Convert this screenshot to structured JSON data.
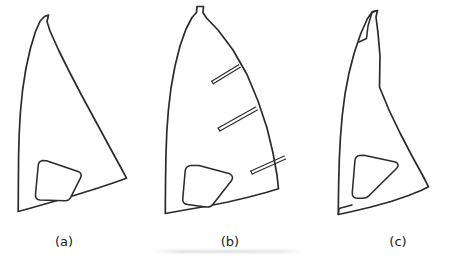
{
  "figure": {
    "background_color": "#ffffff",
    "line_color": "#2b2b2b",
    "panels": [
      {
        "id": "a",
        "caption": "(a)",
        "caption_x": 64,
        "description": "Soft sail outline with curved luff, straight leech, curved foot and a rounded trapezoidal window",
        "features": {
          "head_notch": true,
          "batten_count": 0,
          "luff_sleeve": false,
          "window_shape": "rounded-trapezoid"
        },
        "outline_path": "M 44.5 16.5 L 40.2 21.0 L 35.5 31.5 L 30.5 48.0 L 26.0 68.0 L 22.6 90.0 L 20.4 112.0 L 19.2 134.0 L 18.6 156.0 L 18.4 178.0 L 18.3 196.0 L 18.2 211.5 L 31.0 208.0 L 52.0 202.0 L 74.0 195.5 L 95.0 189.0 L 113.0 183.0 L 126.5 178.2 L 120.0 166.0 L 108.0 144.0 L 95.0 120.0 L 82.0 96.0 L 70.0 73.0 L 59.0 51.0 L 50.0 31.0 L 47.0 21.5 L 48.5 15.0 Z",
        "window_path": "M 42.5 160.5 C 40.0 161.0 38.5 162.8 38.2 165.5 L 35.5 194.5 C 35.2 197.8 36.8 199.8 40.0 200.0 L 65.0 200.8 C 67.8 200.9 69.6 199.6 70.8 197.2 L 80.5 177.8 C 82.0 174.8 81.0 172.5 78.0 171.4 L 46.5 160.8 Z"
      },
      {
        "id": "b",
        "caption": "(b)",
        "caption_x": 230,
        "description": "Fuller roached sail outline with three batten pockets along the leech and a rounded pentagonal window",
        "features": {
          "head_notch": true,
          "batten_count": 3,
          "luff_sleeve": false,
          "window_shape": "rounded-pentagon"
        },
        "outline_path": "M 196.5 12.5 L 192.0 17.5 L 186.0 29.0 L 180.0 46.0 L 175.0 66.0 L 171.0 88.0 L 168.4 110.0 L 166.8 132.0 L 166.0 154.0 L 165.6 176.0 L 165.4 196.0 L 165.3 213.5 L 182.0 210.5 L 205.0 206.5 L 228.0 202.0 L 249.0 197.0 L 266.0 192.5 L 278.5 188.8 L 277.0 175.0 L 273.0 153.0 L 267.0 128.0 L 258.0 101.0 L 247.0 74.5 L 233.0 50.0 L 218.0 30.0 L 206.5 18.0 L 203.0 12.5 L 203.5 6.5 L 197.0 6.5 Z",
        "window_path": "M 190.5 165.5 C 187.5 166.0 185.6 167.8 185.2 170.8 L 182.8 198.5 C 182.5 202.0 184.2 204.2 187.6 204.6 L 206.0 207.0 C 209.0 207.4 211.2 206.5 213.0 204.2 L 231.2 181.0 C 233.4 178.2 232.9 175.6 229.8 173.8 L 199.0 165.5 Z",
        "battens": [
          {
            "index": 1,
            "inner": [
              212.5,
              82.5
            ],
            "outer": [
              239.5,
              66.0
            ],
            "thickness": 3.0
          },
          {
            "index": 2,
            "inner": [
              219.0,
              129.5
            ],
            "outer": [
              256.5,
              108.5
            ],
            "thickness": 3.2
          },
          {
            "index": 3,
            "inner": [
              251.5,
              172.5
            ],
            "outer": [
              285.0,
              157.5
            ],
            "thickness": 3.2
          }
        ]
      },
      {
        "id": "c",
        "caption": "(c)",
        "caption_x": 398,
        "description": "Sail outline with a narrow tubular luff sleeve along the leading edge and a rounded triangular window",
        "features": {
          "head_notch": false,
          "batten_count": 0,
          "luff_sleeve": true,
          "window_shape": "rounded-triangle"
        },
        "outline_path": "M 372.5 11.5 L 367.5 18.5 L 361.0 33.0 L 354.5 52.0 L 349.0 73.0 L 345.0 94.0 L 342.2 116.0 L 340.4 138.0 L 339.3 160.0 L 338.7 182.0 L 338.4 201.0 L 338.3 214.5 L 352.0 211.5 L 371.0 207.0 L 391.0 201.5 L 408.5 195.5 L 421.0 190.5 L 428.5 186.8 L 423.0 176.0 L 412.0 156.0 L 400.0 133.0 L 389.0 110.0 L 379.5 87.0 L 380.0 56.0 L 378.0 33.0 L 376.0 17.0 L 377.5 10.5 Z",
        "window_path": "M 359.5 155.5 C 356.8 156.0 355.2 157.8 354.9 160.8 L 352.3 192.5 C 352.0 196.0 353.8 198.2 357.2 198.2 L 363.0 198.2 C 365.6 198.2 367.6 197.2 369.4 195.2 L 396.5 168.5 C 399.0 166.0 398.6 163.4 395.4 162.0 L 364.0 155.2 Z",
        "sleeve_path": "M 377.5 10.5 L 372.0 12.5 L 368.0 26.0 L 366.5 38.5 L 359.0 42.0",
        "sleeve_foot_path": "M 338.3 214.5 L 339.0 208.5 L 352.0 205.0"
      }
    ]
  }
}
